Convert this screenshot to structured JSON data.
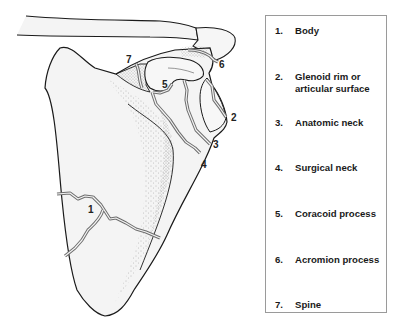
{
  "figure": {
    "callouts": [
      {
        "num": "1",
        "x": 89,
        "y": 211
      },
      {
        "num": "2",
        "x": 230,
        "y": 120
      },
      {
        "num": "3",
        "x": 214,
        "y": 149
      },
      {
        "num": "4",
        "x": 202,
        "y": 168
      },
      {
        "num": "5",
        "x": 163,
        "y": 90
      },
      {
        "num": "6",
        "x": 219,
        "y": 68
      },
      {
        "num": "7",
        "x": 127,
        "y": 63
      }
    ],
    "colors": {
      "outline": "#1a1a1a",
      "bone_fill": "#f3f3f3",
      "fracture_line": "#6e6e6e",
      "stipple": "#8a8a8a",
      "legend_border": "#9a9a9a"
    }
  },
  "legend": {
    "items": [
      {
        "num": "1.",
        "text": "Body",
        "top": 9
      },
      {
        "num": "2.",
        "text": "Glenoid rim or articular surface",
        "top": 55
      },
      {
        "num": "3.",
        "text": "Anatomic neck",
        "top": 101
      },
      {
        "num": "4.",
        "text": "Surgical neck",
        "top": 146
      },
      {
        "num": "5.",
        "text": "Coracoid process",
        "top": 192
      },
      {
        "num": "6.",
        "text": "Acromion process",
        "top": 238
      },
      {
        "num": "7.",
        "text": "Spine",
        "top": 283
      }
    ]
  }
}
